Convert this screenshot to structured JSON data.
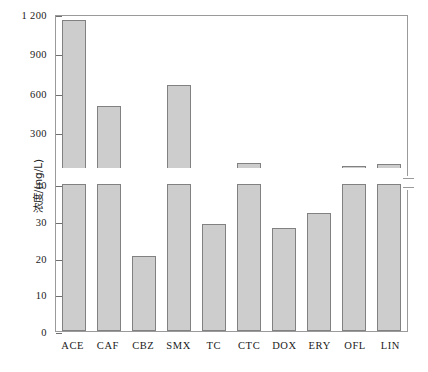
{
  "chart_data": {
    "type": "bar",
    "title": "",
    "xlabel": "",
    "ylabel": "浓度/(ng/L)",
    "categories": [
      "ACE",
      "CAF",
      "CBZ",
      "SMX",
      "TC",
      "CTC",
      "DOX",
      "ERY",
      "OFL",
      "LIN"
    ],
    "values": [
      1170,
      510,
      20.5,
      670,
      29,
      75,
      28,
      32,
      41,
      70
    ],
    "broken_axis": true,
    "lower_ylim": [
      0,
      40
    ],
    "upper_ylim": [
      40,
      1200
    ],
    "lower_ticks": [
      0,
      10,
      20,
      30,
      40
    ],
    "upper_ticks": [
      300,
      600,
      900,
      1200
    ],
    "upper_tick_labels": [
      "300",
      "600",
      "900",
      "1 200"
    ],
    "break_value": 40,
    "grid": false,
    "legend": "none",
    "bar_color": "#cdcdcd",
    "bar_border_color": "#818181",
    "axis_color": "#9a9a9a"
  }
}
